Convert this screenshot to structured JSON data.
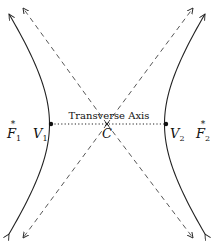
{
  "diagram": {
    "center": {
      "label": "C",
      "x": 107,
      "y": 124
    },
    "vertices": [
      {
        "label": "V",
        "sub": "1",
        "x": 51,
        "y": 124
      },
      {
        "label": "V",
        "sub": "2",
        "x": 166,
        "y": 124
      }
    ],
    "foci": [
      {
        "label": "F",
        "sub": "1",
        "x": 13,
        "y": 124
      },
      {
        "label": "F",
        "sub": "2",
        "x": 203,
        "y": 124
      }
    ],
    "axis_label": "Transverse Axis",
    "colors": {
      "stroke": "#222222",
      "dashed": "#444444",
      "background": "#ffffff"
    }
  }
}
